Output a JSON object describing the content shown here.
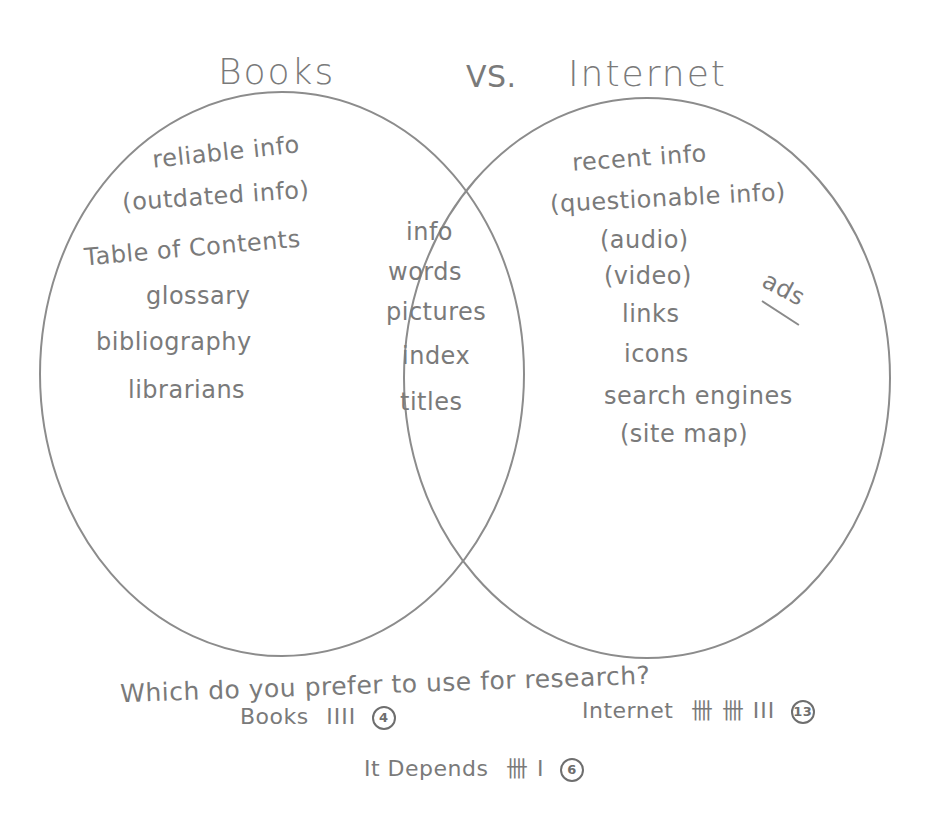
{
  "diagram": {
    "type": "venn",
    "title": {
      "left": "Books",
      "separator": "VS.",
      "right": "Internet"
    },
    "left_only": {
      "label": "Books",
      "items": [
        "reliable info",
        "(outdated info)",
        "Table of Contents",
        "glossary",
        "bibliography",
        "librarians"
      ]
    },
    "overlap": {
      "label": "Both",
      "items": [
        "info",
        "words",
        "pictures",
        "index",
        "titles"
      ]
    },
    "right_only": {
      "label": "Internet",
      "items": [
        "recent info",
        "(questionable info)",
        "(audio)",
        "(video)",
        "links",
        "icons",
        "search engines",
        "(site map)"
      ],
      "side_note": "ads"
    },
    "survey": {
      "question": "Which do you prefer to use for research?",
      "responses": [
        {
          "option": "Books",
          "tally": "IIII",
          "count": "4"
        },
        {
          "option": "Internet",
          "tally": "卌 卌 III",
          "count": "13"
        },
        {
          "option": "It Depends",
          "tally": "卌 I",
          "count": "6"
        }
      ]
    },
    "colors": {
      "pencil": "#7a7a7a",
      "background": "#ffffff"
    }
  }
}
